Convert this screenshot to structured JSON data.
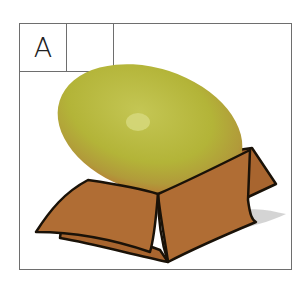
{
  "panel": {
    "label": "A",
    "blank_cell": ""
  },
  "illustration": {
    "subject": "egg-in-open-box",
    "egg_color": "#b5b53a",
    "egg_rim_color": "#c08a3a",
    "box_color": "#b06d34",
    "box_dark": "#8a5026",
    "outline_color": "#1a1208",
    "shadow_color": "#cfcfcf"
  }
}
